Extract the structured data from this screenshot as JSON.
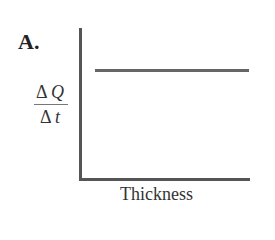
{
  "panel": {
    "label": "A.",
    "ylabel": {
      "numerator_symbol": "Δ",
      "numerator_var": "Q",
      "denominator_symbol": "Δ",
      "denominator_var": "t"
    },
    "xlabel": "Thickness"
  },
  "chart_data": {
    "type": "line",
    "title": "A.",
    "xlabel": "Thickness",
    "ylabel": "ΔQ/Δt",
    "series": [
      {
        "name": "ΔQ/Δt vs Thickness",
        "x": [
          0.1,
          1.0
        ],
        "y": [
          0.72,
          0.72
        ]
      }
    ],
    "grid": false,
    "ticks": "none"
  }
}
